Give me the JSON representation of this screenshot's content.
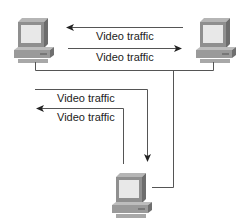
{
  "diagram": {
    "nodes": [
      {
        "id": "pc-left",
        "type": "computer",
        "icon": "desktop-computer-icon"
      },
      {
        "id": "pc-right",
        "type": "computer",
        "icon": "desktop-computer-icon"
      },
      {
        "id": "pc-bottom",
        "type": "computer",
        "icon": "desktop-computer-icon"
      }
    ],
    "flows": [
      {
        "label": "Video traffic",
        "from": "pc-right",
        "to": "pc-left"
      },
      {
        "label": "Video traffic",
        "from": "pc-left",
        "to": "pc-right"
      },
      {
        "label": "Video traffic",
        "from": "pc-left",
        "to": "pc-bottom"
      },
      {
        "label": "Video traffic",
        "from": "pc-bottom",
        "to": "pc-left"
      }
    ],
    "colors": {
      "line": "#555555",
      "monitor_body": "#8a8a8a",
      "screen": "#e6e6e6",
      "base": "#9a9a9a"
    }
  }
}
